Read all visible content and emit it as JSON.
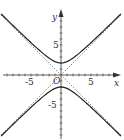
{
  "chart_data": {
    "type": "line",
    "title": "",
    "xlabel": "x",
    "ylabel": "y",
    "origin_label": "O",
    "xlim": [
      -10,
      10
    ],
    "ylim": [
      -11,
      11
    ],
    "grid": false,
    "x_tick_labels": [
      {
        "value": -5,
        "label": "-5"
      },
      {
        "value": 5,
        "label": "5"
      }
    ],
    "y_tick_labels": [
      {
        "value": 5,
        "label": "5"
      },
      {
        "value": -5,
        "label": "-5"
      }
    ],
    "series": [
      {
        "name": "hyperbola",
        "equation": "y^2 - x^2 = 4",
        "style": "solid",
        "branches": [
          "upper",
          "lower"
        ],
        "vertices": [
          [
            0,
            2
          ],
          [
            0,
            -2
          ]
        ]
      },
      {
        "name": "asymptote-1",
        "equation": "y = x",
        "style": "dashed"
      },
      {
        "name": "asymptote-2",
        "equation": "y = -x",
        "style": "dashed"
      }
    ],
    "colors": {
      "curve": "#222222",
      "asymptote": "#555555",
      "axis": "#333333"
    }
  }
}
